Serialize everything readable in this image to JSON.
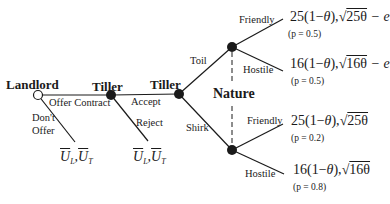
{
  "players": {
    "landlord": "Landlord",
    "tiller1": "Tiller",
    "tiller2": "Tiller",
    "nature": "Nature"
  },
  "actions": {
    "offer_contract": "Offer Contract",
    "dont_offer_line1": "Don't",
    "dont_offer_line2": "Offer",
    "accept": "Accept",
    "reject": "Reject",
    "toil": "Toil",
    "shirk": "Shirk",
    "friendly_toil": "Friendly",
    "hostile_toil": "Hostile",
    "friendly_shirk": "Friendly",
    "hostile_shirk": "Hostile"
  },
  "payoffs": {
    "dont_offer": {
      "u": "U",
      "l": "L",
      "t": "T",
      "sep": ","
    },
    "reject": {
      "u": "U",
      "l": "L",
      "t": "T",
      "sep": ","
    },
    "toil_friendly": "25(1−θ), √25θ − e",
    "toil_hostile": "16(1−θ), √16θ − e",
    "shirk_friendly": "25(1−θ), √25θ",
    "shirk_hostile": "16(1−θ), √16θ"
  },
  "payoff_parts": {
    "toil_friendly": {
      "coef": "25",
      "mid": "(1−",
      "theta": "θ",
      "close": "),",
      "root": "√",
      "rootarg": "25θ",
      "tail": " − e"
    },
    "toil_hostile": {
      "coef": "16",
      "mid": "(1−",
      "theta": "θ",
      "close": "),",
      "root": "√",
      "rootarg": "16θ",
      "tail": " − e"
    },
    "shirk_friendly": {
      "coef": "25",
      "mid": "(1−",
      "theta": "θ",
      "close": "),",
      "root": "√",
      "rootarg": "25θ",
      "tail": ""
    },
    "shirk_hostile": {
      "coef": "16",
      "mid": "(1−",
      "theta": "θ",
      "close": "),",
      "root": "√",
      "rootarg": "16θ",
      "tail": ""
    }
  },
  "probabilities": {
    "toil_friendly": "(p = 0.5)",
    "toil_hostile": "(p = 0.5)",
    "shirk_friendly": "(p = 0.2)",
    "shirk_hostile": "(p = 0.8)"
  },
  "colors": {
    "line": "#1a1a1a",
    "background": "#ffffff"
  }
}
